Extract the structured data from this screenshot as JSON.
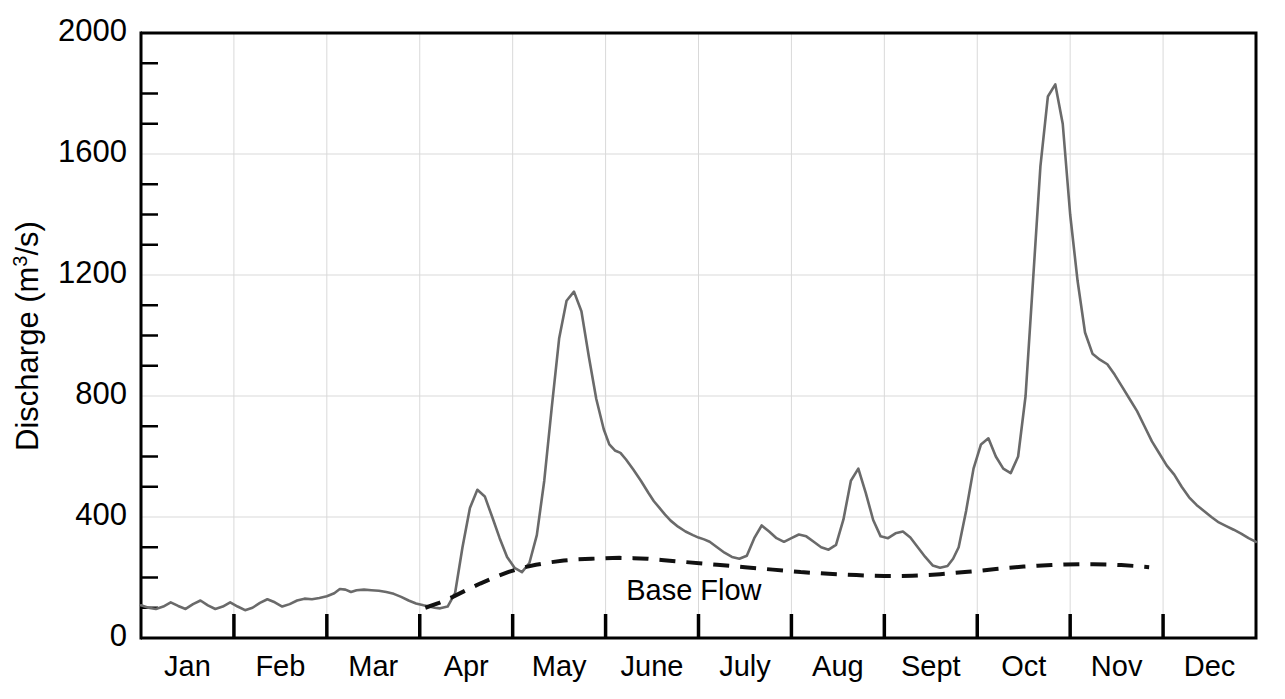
{
  "chart_data": {
    "type": "line",
    "title": "",
    "xlabel": "",
    "ylabel": "Discharge (m3/s)",
    "ylabel_base": "Discharge (m",
    "ylabel_sup": "3",
    "ylabel_tail": "/s)",
    "ylim": [
      0,
      2000
    ],
    "xlim": [
      0,
      12
    ],
    "grid": true,
    "legend_position": "none",
    "y_major_ticks": [
      0,
      400,
      800,
      1200,
      1600,
      2000
    ],
    "y_tick_labels": [
      "0",
      "400",
      "800",
      "1200",
      "1600",
      "2000"
    ],
    "y_minor_step": 100,
    "categories": [
      "Jan",
      "Feb",
      "Mar",
      "Apr",
      "May",
      "June",
      "July",
      "Aug",
      "Sept",
      "Oct",
      "Nov",
      "Dec"
    ],
    "annotations": [
      {
        "text": "Base Flow",
        "x": 5.95,
        "y": 125
      }
    ],
    "series": [
      {
        "name": "Streamflow",
        "style": "solid",
        "color": "#6a6a6a",
        "x": [
          0.0,
          0.08,
          0.16,
          0.24,
          0.32,
          0.4,
          0.48,
          0.56,
          0.64,
          0.72,
          0.8,
          0.88,
          0.96,
          1.04,
          1.12,
          1.2,
          1.28,
          1.36,
          1.44,
          1.52,
          1.6,
          1.68,
          1.76,
          1.84,
          1.92,
          2.0,
          2.08,
          2.14,
          2.2,
          2.26,
          2.32,
          2.4,
          2.48,
          2.56,
          2.64,
          2.72,
          2.8,
          2.88,
          2.96,
          3.04,
          3.1,
          3.16,
          3.22,
          3.3,
          3.38,
          3.46,
          3.54,
          3.62,
          3.7,
          3.78,
          3.86,
          3.94,
          4.02,
          4.1,
          4.18,
          4.26,
          4.34,
          4.42,
          4.5,
          4.58,
          4.66,
          4.74,
          4.82,
          4.9,
          4.98,
          5.04,
          5.1,
          5.16,
          5.22,
          5.3,
          5.38,
          5.46,
          5.52,
          5.58,
          5.64,
          5.7,
          5.78,
          5.86,
          5.94,
          6.0,
          6.06,
          6.12,
          6.2,
          6.28,
          6.36,
          6.44,
          6.52,
          6.6,
          6.68,
          6.76,
          6.84,
          6.92,
          7.0,
          7.08,
          7.16,
          7.24,
          7.32,
          7.4,
          7.48,
          7.56,
          7.64,
          7.72,
          7.8,
          7.88,
          7.96,
          8.04,
          8.12,
          8.2,
          8.28,
          8.36,
          8.44,
          8.52,
          8.6,
          8.68,
          8.74,
          8.8,
          8.88,
          8.96,
          9.04,
          9.12,
          9.2,
          9.28,
          9.36,
          9.44,
          9.52,
          9.6,
          9.68,
          9.76,
          9.84,
          9.92,
          10.0,
          10.08,
          10.16,
          10.24,
          10.32,
          10.4,
          10.48,
          10.56,
          10.64,
          10.72,
          10.8,
          10.88,
          10.96,
          11.04,
          11.12,
          11.2,
          11.28,
          11.36,
          11.44,
          11.52,
          11.6,
          11.68,
          11.76,
          11.84,
          11.92,
          12.0
        ],
        "y": [
          108,
          100,
          96,
          104,
          118,
          106,
          96,
          112,
          124,
          108,
          96,
          104,
          118,
          104,
          92,
          100,
          116,
          128,
          118,
          104,
          112,
          124,
          130,
          128,
          132,
          138,
          148,
          162,
          160,
          152,
          158,
          160,
          158,
          156,
          152,
          146,
          136,
          124,
          114,
          108,
          104,
          100,
          98,
          104,
          148,
          300,
          430,
          490,
          468,
          400,
          330,
          268,
          232,
          218,
          248,
          340,
          520,
          760,
          990,
          1115,
          1145,
          1080,
          930,
          790,
          690,
          640,
          620,
          612,
          590,
          556,
          520,
          480,
          452,
          430,
          408,
          388,
          368,
          352,
          340,
          332,
          326,
          318,
          300,
          282,
          268,
          262,
          272,
          330,
          372,
          352,
          330,
          318,
          330,
          342,
          336,
          318,
          300,
          292,
          308,
          392,
          520,
          560,
          480,
          390,
          336,
          330,
          346,
          352,
          332,
          300,
          268,
          240,
          232,
          238,
          262,
          300,
          420,
          560,
          640,
          660,
          600,
          560,
          545,
          600,
          800,
          1180,
          1560,
          1790,
          1830,
          1700,
          1400,
          1180,
          1010,
          940,
          920,
          905,
          870,
          830,
          790,
          750,
          700,
          650,
          610,
          570,
          540,
          500,
          465,
          440,
          420,
          400,
          382,
          370,
          358,
          345,
          330,
          318
        ]
      }
    ],
    "series_continued": [
      {
        "name": "Streamflow-second-half",
        "x": [
          7.0,
          7.1,
          7.2,
          7.3,
          7.4,
          7.5,
          7.6,
          7.7,
          7.8,
          7.9,
          8.0,
          8.1,
          8.2,
          8.3,
          8.4,
          8.5,
          8.6,
          8.7,
          8.8,
          8.9,
          9.0,
          9.1,
          9.2,
          9.3,
          9.4,
          9.5,
          9.6,
          9.7,
          9.8,
          9.9,
          10.0,
          10.1,
          10.2,
          10.3,
          10.4,
          10.5,
          10.6,
          10.7,
          10.8,
          10.9,
          11.0,
          11.1,
          11.2,
          11.3,
          11.4,
          11.5,
          11.6,
          11.7,
          11.8,
          11.9,
          12.0
        ],
        "y": [
          560,
          500,
          460,
          430,
          400,
          380,
          362,
          348,
          338,
          330,
          320,
          312,
          305,
          298,
          290,
          282,
          275,
          268,
          262,
          256,
          250,
          246,
          242,
          238,
          235,
          232,
          230,
          228,
          226,
          224,
          222,
          220,
          218,
          216,
          214,
          212,
          210,
          208,
          206,
          204,
          202,
          200,
          198,
          196,
          194,
          192,
          190,
          188,
          186,
          184,
          182
        ]
      }
    ],
    "baseflow": {
      "name": "Base Flow",
      "style": "dashed",
      "color": "#111111",
      "x": [
        3.06,
        3.2,
        3.35,
        3.5,
        3.65,
        3.8,
        3.95,
        4.1,
        4.25,
        4.4,
        4.55,
        4.7,
        4.85,
        5.0,
        5.15,
        5.3,
        5.45,
        5.6,
        5.75,
        5.9,
        6.05,
        6.2,
        6.35,
        6.5,
        6.65,
        6.8,
        6.95,
        7.1,
        7.25,
        7.4,
        7.55,
        7.7,
        7.85,
        8.0,
        8.15,
        8.3,
        8.45,
        8.6,
        8.75,
        8.9,
        9.05,
        9.2,
        9.35,
        9.5,
        9.65,
        9.8,
        9.95,
        10.1,
        10.25,
        10.4,
        10.55,
        10.7,
        10.85
      ],
      "y": [
        100,
        115,
        135,
        158,
        180,
        200,
        218,
        232,
        242,
        250,
        256,
        260,
        262,
        264,
        265,
        264,
        262,
        258,
        254,
        250,
        246,
        242,
        238,
        234,
        230,
        226,
        222,
        218,
        215,
        212,
        210,
        208,
        206,
        205,
        205,
        206,
        208,
        211,
        215,
        219,
        223,
        228,
        232,
        236,
        239,
        241,
        243,
        244,
        244,
        243,
        241,
        238,
        234
      ]
    }
  },
  "plot_geometry": {
    "left": 141,
    "right": 1256,
    "top": 33,
    "bottom": 638
  }
}
